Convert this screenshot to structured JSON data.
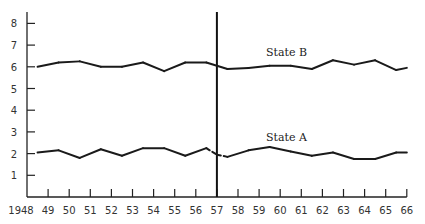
{
  "chart_data": {
    "type": "line",
    "title": "",
    "xlabel": "",
    "ylabel": "",
    "ylim": [
      0,
      8.5
    ],
    "xlim": [
      1948,
      1966
    ],
    "y_ticks": [
      1,
      2,
      3,
      4,
      5,
      6,
      7,
      8
    ],
    "x_tick_labels": [
      "1948",
      "49",
      "50",
      "51",
      "52",
      "53",
      "54",
      "55",
      "56",
      "57",
      "58",
      "59",
      "60",
      "61",
      "62",
      "63",
      "64",
      "65",
      "66"
    ],
    "grid": false,
    "legend": "inline labels",
    "annotations": [
      {
        "type": "vertical-line",
        "x": 1957,
        "label": ""
      }
    ],
    "series": [
      {
        "name": "State B",
        "label_position": {
          "x": 1960.3,
          "y": 6.5
        },
        "x": [
          1948.5,
          1949.5,
          1950.5,
          1951.5,
          1952.5,
          1953.5,
          1954.5,
          1955.5,
          1956.5,
          1957.0,
          1957.5,
          1958.5,
          1959.5,
          1960.5,
          1961.5,
          1962.5,
          1963.5,
          1964.5,
          1965.5,
          1966.0
        ],
        "values": [
          6.0,
          6.2,
          6.25,
          6.0,
          6.0,
          6.2,
          5.8,
          6.2,
          6.2,
          6.05,
          5.9,
          5.95,
          6.05,
          6.05,
          5.9,
          6.3,
          6.1,
          6.3,
          5.85,
          5.95
        ],
        "dashed_segments": []
      },
      {
        "name": "State A",
        "label_position": {
          "x": 1960.3,
          "y": 2.6
        },
        "x": [
          1948.5,
          1949.5,
          1950.5,
          1951.5,
          1952.5,
          1953.5,
          1954.5,
          1955.5,
          1956.5,
          1957.0,
          1957.5,
          1958.5,
          1959.5,
          1960.5,
          1961.5,
          1962.5,
          1963.5,
          1964.5,
          1965.5,
          1966.0
        ],
        "values": [
          2.05,
          2.15,
          1.8,
          2.2,
          1.9,
          2.25,
          2.25,
          1.9,
          2.25,
          1.95,
          1.85,
          2.15,
          2.3,
          2.1,
          1.9,
          2.05,
          1.75,
          1.75,
          2.05,
          2.05
        ],
        "dashed_segments": [
          [
            1956.5,
            1957.5
          ]
        ]
      }
    ]
  }
}
